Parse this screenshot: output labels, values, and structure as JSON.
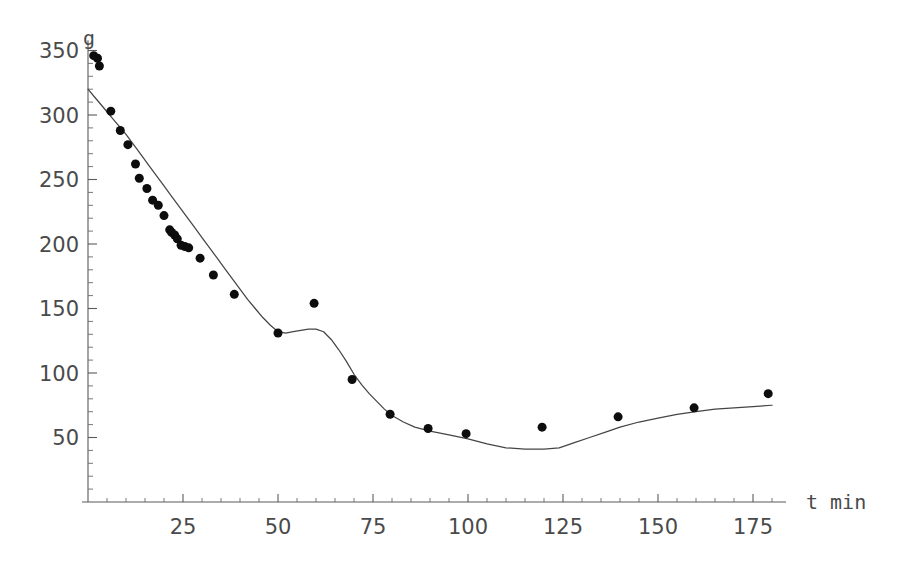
{
  "chart_data": {
    "type": "scatter",
    "title": "",
    "subtitle": "",
    "xlabel": "t min",
    "ylabel": "g",
    "xlim": [
      0,
      184
    ],
    "ylim": [
      0,
      360
    ],
    "grid": false,
    "legend": "none",
    "axis_style": "mathematica-free-axes",
    "x_ticks_major": [
      25,
      50,
      75,
      100,
      125,
      150,
      175
    ],
    "x_tick_labels": [
      "25",
      "50",
      "75",
      "100",
      "125",
      "150",
      "175"
    ],
    "x_minor_tick_step": 5,
    "y_ticks_major": [
      50,
      100,
      150,
      200,
      250,
      300,
      350
    ],
    "y_tick_labels": [
      "50",
      "100",
      "150",
      "200",
      "250",
      "300",
      "350"
    ],
    "y_minor_tick_step": 10,
    "series": [
      {
        "name": "measured data",
        "type": "scatter",
        "marker": "filled-circle",
        "marker_color": "#0d0d0d",
        "marker_size_px": 9,
        "points": [
          [
            1.5,
            346
          ],
          [
            2.5,
            344
          ],
          [
            3.0,
            338
          ],
          [
            6.0,
            303
          ],
          [
            8.5,
            288
          ],
          [
            10.5,
            277
          ],
          [
            12.5,
            262
          ],
          [
            13.5,
            251
          ],
          [
            15.5,
            243
          ],
          [
            17.0,
            234
          ],
          [
            18.5,
            230
          ],
          [
            20.0,
            222
          ],
          [
            21.5,
            211
          ],
          [
            22.0,
            209
          ],
          [
            22.8,
            207
          ],
          [
            23.5,
            204
          ],
          [
            24.5,
            199
          ],
          [
            25.5,
            198
          ],
          [
            26.5,
            197
          ],
          [
            29.5,
            189
          ],
          [
            33.0,
            176
          ],
          [
            38.5,
            161
          ],
          [
            50.0,
            131
          ],
          [
            59.5,
            154
          ],
          [
            69.5,
            95
          ],
          [
            79.5,
            68
          ],
          [
            89.5,
            57
          ],
          [
            99.5,
            53
          ],
          [
            119.5,
            58
          ],
          [
            139.5,
            66
          ],
          [
            159.5,
            73
          ],
          [
            179.0,
            84
          ]
        ]
      },
      {
        "name": "fitted model curve",
        "type": "line",
        "line_color": "#454545",
        "points": [
          [
            0,
            320
          ],
          [
            2,
            313
          ],
          [
            4,
            306
          ],
          [
            6,
            299
          ],
          [
            8,
            292
          ],
          [
            10,
            285
          ],
          [
            12,
            277
          ],
          [
            14,
            269
          ],
          [
            16,
            261
          ],
          [
            18,
            253
          ],
          [
            20,
            245
          ],
          [
            22,
            237
          ],
          [
            24,
            229
          ],
          [
            26,
            221
          ],
          [
            28,
            213
          ],
          [
            30,
            205
          ],
          [
            32,
            197
          ],
          [
            34,
            189
          ],
          [
            36,
            181
          ],
          [
            38,
            173
          ],
          [
            40,
            165
          ],
          [
            42,
            157
          ],
          [
            44,
            150
          ],
          [
            46,
            143
          ],
          [
            48,
            137
          ],
          [
            50,
            132
          ],
          [
            52,
            131
          ],
          [
            54,
            132
          ],
          [
            56,
            133
          ],
          [
            58,
            134
          ],
          [
            60,
            134
          ],
          [
            62,
            132
          ],
          [
            64,
            126
          ],
          [
            66,
            118
          ],
          [
            68,
            109
          ],
          [
            70,
            99
          ],
          [
            72,
            91
          ],
          [
            74,
            84
          ],
          [
            76,
            78
          ],
          [
            78,
            72
          ],
          [
            80,
            67
          ],
          [
            83,
            62
          ],
          [
            86,
            58
          ],
          [
            90,
            55
          ],
          [
            95,
            52
          ],
          [
            100,
            49
          ],
          [
            105,
            45
          ],
          [
            110,
            42
          ],
          [
            115,
            41
          ],
          [
            120,
            41
          ],
          [
            124,
            42
          ],
          [
            128,
            46
          ],
          [
            132,
            50
          ],
          [
            136,
            54
          ],
          [
            140,
            58
          ],
          [
            145,
            62
          ],
          [
            150,
            65
          ],
          [
            155,
            68
          ],
          [
            160,
            70
          ],
          [
            165,
            72
          ],
          [
            170,
            73
          ],
          [
            175,
            74
          ],
          [
            180,
            75
          ]
        ]
      }
    ]
  },
  "geometry": {
    "x_origin_px": 88,
    "y_origin_px": 502,
    "px_per_x_unit": 3.8,
    "px_per_y_unit": 1.29,
    "x_axis_end_px": 786,
    "y_axis_top_px": 62
  },
  "labels": {
    "y_axis_name": "g",
    "x_axis_name": "t min"
  }
}
